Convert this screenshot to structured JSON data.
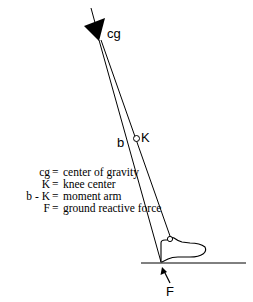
{
  "diagram": {
    "labels": {
      "cg": "cg",
      "knee": "K",
      "b": "b",
      "force": "F"
    },
    "legend": [
      {
        "key": "cg",
        "eq": "=",
        "desc": "center of gravity"
      },
      {
        "key": "K",
        "eq": "=",
        "desc": "knee center"
      },
      {
        "key": "b - K",
        "eq": "=",
        "desc": "moment arm"
      },
      {
        "key": "F",
        "eq": "=",
        "desc": "ground reactive force"
      }
    ],
    "colors": {
      "stroke": "#000000",
      "background": "#ffffff"
    }
  }
}
